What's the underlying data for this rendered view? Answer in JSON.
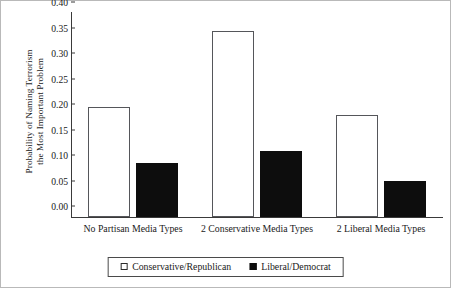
{
  "chart_data": {
    "type": "bar",
    "title": "",
    "xlabel": "",
    "ylabel": "Probability of Naming Terrorism the Most Important Problem",
    "ylabel_line1": "Probability of Naming Terrorism",
    "ylabel_line2": "the Most Important Problem",
    "categories": [
      "No Partisan Media Types",
      "2 Conservative Media Types",
      "2 Liberal Media Types"
    ],
    "series": [
      {
        "name": "Conservative/Republican",
        "style": "open",
        "color": "#ffffff",
        "edge_color": "#55565a",
        "values": [
          0.215,
          0.365,
          0.2
        ]
      },
      {
        "name": "Liberal/Democrat",
        "style": "filled",
        "color": "#0d0d0d",
        "edge_color": "#0d0d0d",
        "values": [
          0.105,
          0.13,
          0.07
        ]
      }
    ],
    "ylim": [
      0.0,
      0.4
    ],
    "yticks": [
      "0.00",
      "0.05",
      "0.10",
      "0.15",
      "0.20",
      "0.25",
      "0.30",
      "0.35",
      "0.40"
    ],
    "ytick_values": [
      0.0,
      0.05,
      0.1,
      0.15,
      0.2,
      0.25,
      0.3,
      0.35,
      0.4
    ],
    "grid": false,
    "legend_position": "bottom-center"
  },
  "legend": {
    "entries": [
      {
        "label": "Conservative/Republican"
      },
      {
        "label": "Liberal/Democrat"
      }
    ]
  }
}
